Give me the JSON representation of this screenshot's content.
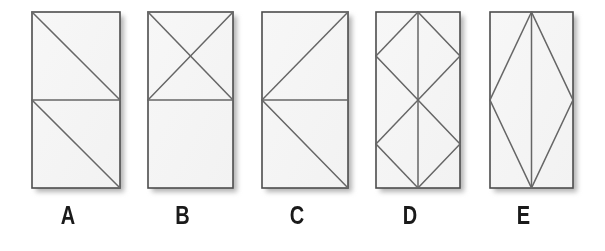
{
  "page": {
    "background_color": "#ffffff",
    "width": 605,
    "height": 251
  },
  "style": {
    "panel_fill": "#f2f2f2",
    "panel_fill_light": "#f7f7f7",
    "border_color": "#4d4d4d",
    "inner_line_color": "#666666",
    "shadow_color": "#b3b3b3",
    "label_color": "#1a1a1a"
  },
  "figures": [
    {
      "id": "figure-a",
      "label": "A",
      "x": 32,
      "y": 12,
      "width": 88,
      "height": 176,
      "description": "rectangle split by a horizontal mid-line; each half crossed by one diagonal running from its top-left to its bottom-right",
      "lines": [
        {
          "name": "horizontal-midline",
          "x1": 0,
          "y1": 88,
          "x2": 88,
          "y2": 88
        },
        {
          "name": "top-half-diagonal",
          "x1": 0,
          "y1": 0,
          "x2": 88,
          "y2": 88
        },
        {
          "name": "bottom-half-diagonal",
          "x1": 0,
          "y1": 88,
          "x2": 88,
          "y2": 176
        }
      ]
    },
    {
      "id": "figure-b",
      "label": "B",
      "x": 148,
      "y": 12,
      "width": 85,
      "height": 176,
      "description": "rectangle split by a horizontal mid-line; top half contains an X of two crossing diagonals, bottom half is empty",
      "lines": [
        {
          "name": "horizontal-midline",
          "x1": 0,
          "y1": 88,
          "x2": 85,
          "y2": 88
        },
        {
          "name": "top-half-diagonal-down",
          "x1": 0,
          "y1": 0,
          "x2": 85,
          "y2": 88
        },
        {
          "name": "top-half-diagonal-up",
          "x1": 0,
          "y1": 88,
          "x2": 85,
          "y2": 0
        }
      ]
    },
    {
      "id": "figure-c",
      "label": "C",
      "x": 262,
      "y": 12,
      "width": 86,
      "height": 176,
      "description": "rectangle split by a horizontal mid-line; two diagonals meet at the left edge midpoint and run to the top-right and bottom-right corners",
      "lines": [
        {
          "name": "horizontal-midline",
          "x1": 0,
          "y1": 88,
          "x2": 86,
          "y2": 88
        },
        {
          "name": "upper-diagonal-to-top-right",
          "x1": 0,
          "y1": 88,
          "x2": 86,
          "y2": 0
        },
        {
          "name": "lower-diagonal-to-bottom-right",
          "x1": 0,
          "y1": 88,
          "x2": 86,
          "y2": 176
        }
      ]
    },
    {
      "id": "figure-d",
      "label": "D",
      "x": 376,
      "y": 12,
      "width": 84,
      "height": 176,
      "description": "rectangle containing two stacked diamonds, each inscribed in one half, plus a full-height vertical centre line",
      "lines": [
        {
          "name": "vertical-centre-line",
          "x1": 42,
          "y1": 0,
          "x2": 42,
          "y2": 176
        },
        {
          "name": "top-diamond-upper-left",
          "x1": 42,
          "y1": 0,
          "x2": 0,
          "y2": 44
        },
        {
          "name": "top-diamond-upper-right",
          "x1": 42,
          "y1": 0,
          "x2": 84,
          "y2": 44
        },
        {
          "name": "top-diamond-lower-left",
          "x1": 0,
          "y1": 44,
          "x2": 42,
          "y2": 88
        },
        {
          "name": "top-diamond-lower-right",
          "x1": 84,
          "y1": 44,
          "x2": 42,
          "y2": 88
        },
        {
          "name": "bottom-diamond-upper-left",
          "x1": 42,
          "y1": 88,
          "x2": 0,
          "y2": 132
        },
        {
          "name": "bottom-diamond-upper-right",
          "x1": 42,
          "y1": 88,
          "x2": 84,
          "y2": 132
        },
        {
          "name": "bottom-diamond-lower-left",
          "x1": 0,
          "y1": 132,
          "x2": 42,
          "y2": 176
        },
        {
          "name": "bottom-diamond-lower-right",
          "x1": 84,
          "y1": 132,
          "x2": 42,
          "y2": 176
        }
      ]
    },
    {
      "id": "figure-e",
      "label": "E",
      "x": 490,
      "y": 12,
      "width": 83,
      "height": 176,
      "description": "rectangle containing one large diamond spanning the full height, plus a full-height vertical centre line",
      "lines": [
        {
          "name": "vertical-centre-line",
          "x1": 41.5,
          "y1": 0,
          "x2": 41.5,
          "y2": 176
        },
        {
          "name": "diamond-upper-left",
          "x1": 41.5,
          "y1": 0,
          "x2": 0,
          "y2": 88
        },
        {
          "name": "diamond-upper-right",
          "x1": 41.5,
          "y1": 0,
          "x2": 83,
          "y2": 88
        },
        {
          "name": "diamond-lower-left",
          "x1": 0,
          "y1": 88,
          "x2": 41.5,
          "y2": 176
        },
        {
          "name": "diamond-lower-right",
          "x1": 83,
          "y1": 88,
          "x2": 41.5,
          "y2": 176
        }
      ]
    }
  ],
  "labels_row": {
    "name": "figure-labels",
    "baseline_y": 228,
    "items": [
      "A",
      "B",
      "C",
      "D",
      "E"
    ]
  }
}
